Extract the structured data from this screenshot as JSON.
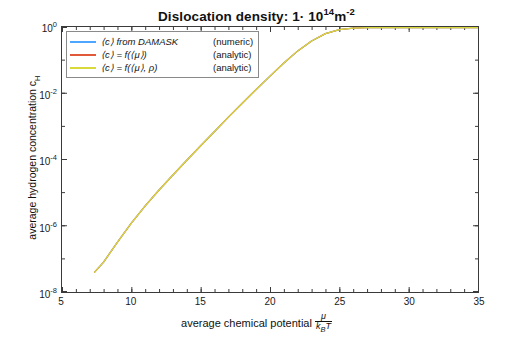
{
  "chart_data": {
    "type": "line",
    "title_main": "Dislocation density: 1· 10",
    "title_sup1": "14",
    "title_mid": "m",
    "title_sup2": "-2",
    "xlabel": "average chemical potential",
    "xlabel_frac_num": "μ",
    "xlabel_frac_den": "k_B T",
    "ylabel": "average hydrogen concentration c_H",
    "ylabel_text": "average hydrogen concentration c",
    "ylabel_sub": "H",
    "xlim": [
      5,
      35
    ],
    "ylim": [
      1e-08,
      1
    ],
    "yscale": "log",
    "xticks": [
      5,
      10,
      15,
      20,
      25,
      30,
      35
    ],
    "ytick_labels": [
      "10",
      "10",
      "10",
      "10",
      "10"
    ],
    "ytick_exponents": [
      "0",
      "-2",
      "-4",
      "-6",
      "-8"
    ],
    "yticks": [
      1,
      0.01,
      0.0001,
      1e-06,
      1e-08
    ],
    "grid": false,
    "legend_position": "top-left",
    "series": [
      {
        "name": "damask-numeric",
        "label_left": "⟨c⟩ from DAMASK",
        "label_right": "(numeric)",
        "color": "#4da6ff",
        "x": [
          7.35,
          8,
          9,
          10,
          11,
          12,
          13,
          14,
          15,
          16,
          17,
          18,
          19,
          20,
          21,
          22,
          23,
          24,
          25,
          26,
          27,
          28,
          29,
          30,
          31,
          32,
          33,
          34,
          35
        ],
        "y": [
          4e-08,
          8e-08,
          3.2e-07,
          1.2e-06,
          4e-06,
          1.2e-05,
          3.4e-05,
          9.5e-05,
          0.00026,
          0.0007,
          0.0019,
          0.005,
          0.013,
          0.033,
          0.082,
          0.19,
          0.38,
          0.63,
          0.83,
          0.93,
          0.973,
          0.99,
          0.996,
          0.9985,
          0.9994,
          0.9997,
          0.9999,
          1.0,
          1.0
        ]
      },
      {
        "name": "analytic-mu",
        "label_left": "⟨c⟩ = f(⟨μ⟩)",
        "label_right": "(analytic)",
        "color": "#e05a3a",
        "x": [
          7.35,
          8,
          9,
          10,
          11,
          12,
          13,
          14,
          15,
          16,
          17,
          18,
          19,
          20,
          21,
          22,
          23,
          24,
          25,
          26,
          27,
          28,
          29,
          30,
          31,
          32,
          33,
          34,
          35
        ],
        "y": [
          4e-08,
          8e-08,
          3.2e-07,
          1.2e-06,
          4e-06,
          1.2e-05,
          3.4e-05,
          9.5e-05,
          0.00026,
          0.0007,
          0.0019,
          0.005,
          0.013,
          0.033,
          0.082,
          0.19,
          0.38,
          0.63,
          0.83,
          0.93,
          0.973,
          0.99,
          0.996,
          0.9985,
          0.9994,
          0.9997,
          0.9999,
          1.0,
          1.0
        ]
      },
      {
        "name": "analytic-mu-rho",
        "label_left": "⟨c⟩ = f(⟨μ⟩, ρ)",
        "label_right": "(analytic)",
        "color": "#d9d93c",
        "x": [
          7.35,
          8,
          9,
          10,
          11,
          12,
          13,
          14,
          15,
          16,
          17,
          18,
          19,
          20,
          21,
          22,
          23,
          24,
          25,
          26,
          27,
          28,
          29,
          30,
          31,
          32,
          33,
          34,
          35
        ],
        "y": [
          4e-08,
          8e-08,
          3.2e-07,
          1.2e-06,
          4e-06,
          1.2e-05,
          3.4e-05,
          9.5e-05,
          0.00026,
          0.0007,
          0.0019,
          0.005,
          0.013,
          0.033,
          0.082,
          0.19,
          0.38,
          0.63,
          0.83,
          0.93,
          0.973,
          0.99,
          0.996,
          0.9985,
          0.9994,
          0.9997,
          0.9999,
          1.0,
          1.0
        ]
      }
    ]
  }
}
